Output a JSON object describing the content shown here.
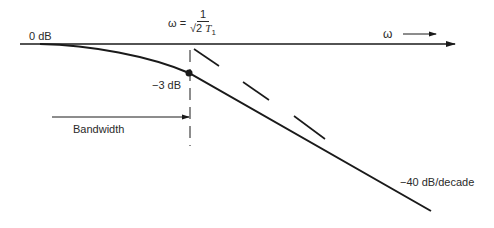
{
  "diagram": {
    "axis_label_zero": "0 dB",
    "axis_label_omega": "ω",
    "corner_frequency": {
      "lhs": "ω =",
      "numerator": "1",
      "denominator_sqrt": "√2",
      "denominator_var": "T",
      "denominator_sub": "1"
    },
    "point_label": "−3 dB",
    "bandwidth_label": "Bandwidth",
    "slope_label": "−40 dB/decade",
    "colors": {
      "line": "#1a1a1a",
      "text": "#2a2a2a",
      "background": "#ffffff"
    }
  }
}
